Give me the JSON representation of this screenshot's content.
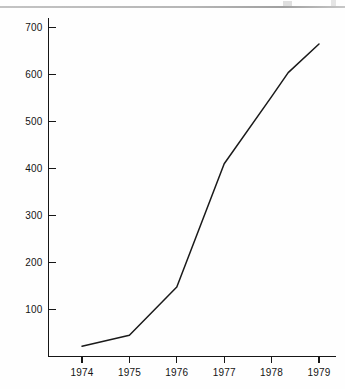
{
  "figure": {
    "background_color": "#fefefe",
    "ink_color": "#1a1a1a",
    "scan_edge_color": "#a9a9a9"
  },
  "chart_data": {
    "type": "line",
    "title": "",
    "subtitle": "",
    "xlabel": "",
    "ylabel": "",
    "x": [
      1974,
      1975,
      1976,
      1977,
      1978,
      1979
    ],
    "categories": [
      "1974",
      "1975",
      "1976",
      "1977",
      "1978",
      "1979"
    ],
    "values": [
      22,
      45,
      148,
      410,
      553,
      665
    ],
    "series": [
      {
        "name": "",
        "values": [
          22,
          45,
          148,
          410,
          553,
          665
        ]
      }
    ],
    "vertices": [
      {
        "x": 1974.0,
        "y": 22
      },
      {
        "x": 1975.0,
        "y": 45
      },
      {
        "x": 1976.0,
        "y": 148
      },
      {
        "x": 1977.0,
        "y": 410
      },
      {
        "x": 1978.0,
        "y": 553
      },
      {
        "x": 1978.35,
        "y": 604
      },
      {
        "x": 1979.0,
        "y": 665
      }
    ],
    "xlim": [
      1973.3,
      1979.55
    ],
    "ylim": [
      0,
      730
    ],
    "ytick_values": [
      100,
      200,
      300,
      400,
      500,
      600,
      700
    ],
    "ytick_labels": [
      "100",
      "200",
      "300",
      "400",
      "500",
      "600",
      "700"
    ],
    "xtick_values": [
      1974,
      1975,
      1976,
      1977,
      1978,
      1979
    ],
    "xtick_labels": [
      "1974",
      "1975",
      "1976",
      "1977",
      "1978",
      "1979"
    ],
    "grid": false,
    "legend": null,
    "legend_position": "none",
    "annotations": [],
    "tick_direction": {
      "y": "in",
      "x": "out"
    },
    "line_color": "#1a1a1a",
    "line_width": 1.5,
    "markers": false
  }
}
